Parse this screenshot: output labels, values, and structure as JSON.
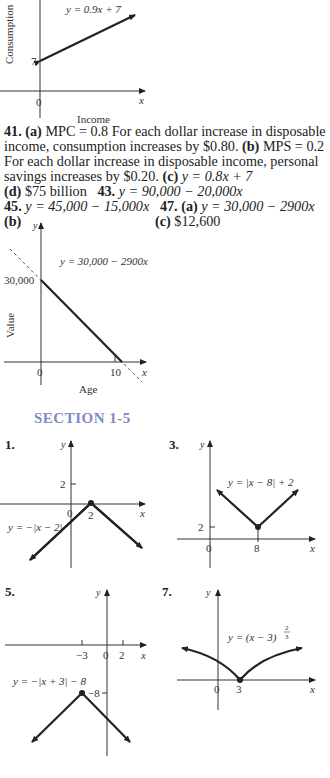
{
  "graph_consumption": {
    "equation": "y = 0.9x + 7",
    "y_axis_label": "Consumption",
    "x_axis_label": "Income",
    "y_tick": "7",
    "origin": "0",
    "x_var": "x"
  },
  "answers": {
    "line1": {
      "num": "41.",
      "a": "(a)",
      "text": " MPC = 0.8 For each dollar increase in disposable"
    },
    "line2": {
      "pre": "income, consumption increases by $0.80. ",
      "b": "(b)",
      "post": " MPS = 0.2"
    },
    "line3": "For each dollar increase in disposable income, personal",
    "line4": {
      "pre": "savings increases by $0.20. ",
      "c": "(c)",
      "post": " y = 0.8x + 7"
    },
    "line5": {
      "d": "(d)",
      "d_text": " $75 billion   ",
      "num43": "43.",
      "text43": " y = 90,000 − 20,000x"
    },
    "line6": {
      "num45": "45.",
      "text45": " y = 45,000 − 15,000x   ",
      "num47": "47.",
      "a": "(a)",
      "text47": " y = 30,000 − 2900x"
    },
    "line7": {
      "b": "(b)",
      "c": "(c)",
      "c_text": " $12,600"
    }
  },
  "graph_value": {
    "equation": "y = 30,000 − 2900x",
    "y_axis_label": "Value",
    "x_axis_label": "Age",
    "y_tick": "30,000",
    "x_tick": "10",
    "origin": "0",
    "x_var": "x",
    "y_var": "y"
  },
  "section": {
    "title": "SECTION 1-5"
  },
  "problems": [
    {
      "num": "1.",
      "equation": "y = −|x − 2|",
      "y_tick": "2",
      "x_tick": "2",
      "origin": "0",
      "x_var": "x",
      "y_var": "y"
    },
    {
      "num": "3.",
      "equation": "y = |x − 8| + 2",
      "y_tick": "2",
      "x_tick": "8",
      "origin": "0",
      "x_var": "x",
      "y_var": "y"
    },
    {
      "num": "5.",
      "equation": "y = −|x + 3| − 8",
      "y_tick": "−8",
      "x_ticks": [
        "−3",
        "0",
        "2"
      ],
      "x_var": "x",
      "y_var": "y"
    },
    {
      "num": "7.",
      "equation": "y = (x − 3)",
      "exponent_num": "2",
      "exponent_den": "3",
      "x_tick": "3",
      "origin": "0",
      "x_var": "x",
      "y_var": "y"
    }
  ]
}
